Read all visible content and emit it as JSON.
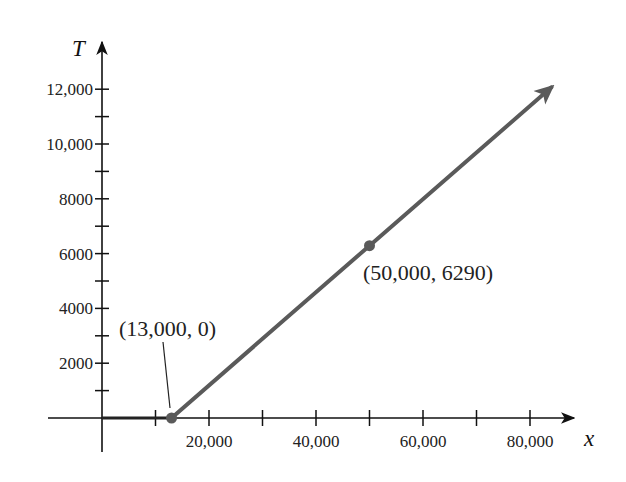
{
  "chart_data": {
    "type": "line",
    "title": "",
    "xlabel": "x",
    "ylabel": "T",
    "xlim": [
      -10000,
      88000
    ],
    "ylim": [
      -1500,
      13500
    ],
    "grid": false,
    "legend": null,
    "x_ticks": [
      10000,
      20000,
      30000,
      40000,
      50000,
      60000,
      70000,
      80000
    ],
    "x_tick_labels": [
      {
        "value": 20000,
        "label": "20,000"
      },
      {
        "value": 40000,
        "label": "40,000"
      },
      {
        "value": 60000,
        "label": "60,000"
      },
      {
        "value": 80000,
        "label": "80,000"
      }
    ],
    "y_ticks": [
      1000,
      2000,
      3000,
      4000,
      5000,
      6000,
      7000,
      8000,
      9000,
      10000,
      11000,
      12000
    ],
    "y_tick_labels": [
      {
        "value": 2000,
        "label": "2000"
      },
      {
        "value": 4000,
        "label": "4000"
      },
      {
        "value": 6000,
        "label": "6000"
      },
      {
        "value": 8000,
        "label": "8000"
      },
      {
        "value": 10000,
        "label": "10,000"
      },
      {
        "value": 12000,
        "label": "12,000"
      }
    ],
    "series": [
      {
        "name": "T(x)",
        "segments": [
          {
            "x": [
              0,
              13000
            ],
            "y": [
              0,
              0
            ],
            "style": "solid dark"
          },
          {
            "x": [
              13000,
              50000,
              84000
            ],
            "y": [
              0,
              6290,
              12070
            ],
            "style": "solid gray with arrow"
          }
        ],
        "color": "#5a5a5a",
        "extends_to_infinity": true
      }
    ],
    "points": [
      {
        "x": 13000,
        "y": 0,
        "label": "(13,000, 0)"
      },
      {
        "x": 50000,
        "y": 6290,
        "label": "(50,000, 6290)"
      }
    ],
    "annotations": [
      {
        "text": "(13,000, 0)",
        "target": [
          13000,
          0
        ],
        "leader_line": true
      },
      {
        "text": "(50,000, 6290)",
        "target": [
          50000,
          6290
        ],
        "leader_line": false
      }
    ]
  },
  "colors": {
    "axis": "#111111",
    "line": "#5a5a5a",
    "point": "#5a5a5a"
  }
}
